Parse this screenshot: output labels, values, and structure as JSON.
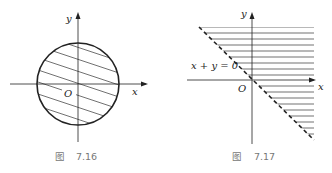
{
  "figures": [
    {
      "id": "fig-7-16",
      "caption_prefix": "图",
      "caption_number": "7.16",
      "axis_labels": {
        "x": "x",
        "y": "y",
        "origin": "O"
      },
      "shape": "circle",
      "region": "interior of circle, hatched"
    },
    {
      "id": "fig-7-17",
      "caption_prefix": "图",
      "caption_number": "7.17",
      "axis_labels": {
        "x": "x",
        "y": "y",
        "origin": "O"
      },
      "boundary_label": "x + y = 0",
      "boundary_style": "dashed",
      "region": "above line x + y = 0, hatched horizontally"
    }
  ],
  "colors": {
    "stroke": "#222222",
    "caption": "#777777",
    "background": "#ffffff"
  }
}
